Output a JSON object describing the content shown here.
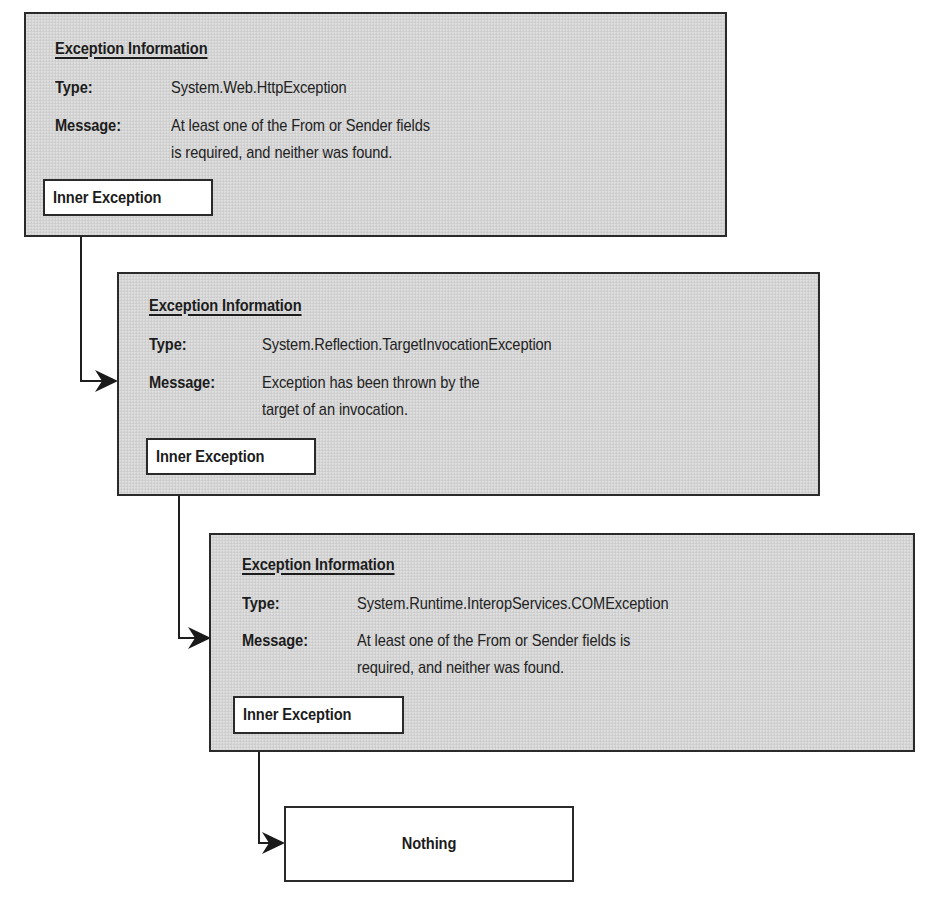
{
  "diagram": {
    "exceptions": [
      {
        "heading": "Exception Information",
        "type_label": "Type:",
        "type_value": "System.Web.HttpException",
        "message_label": "Message:",
        "message_lines": [
          "At least one of the From or Sender fields",
          "is required, and neither was found."
        ],
        "inner_label": "Inner Exception"
      },
      {
        "heading": "Exception Information",
        "type_label": "Type:",
        "type_value": "System.Reflection.TargetInvocationException",
        "message_label": "Message:",
        "message_lines": [
          "Exception has been thrown by the",
          "target of an invocation."
        ],
        "inner_label": "Inner Exception"
      },
      {
        "heading": "Exception Information",
        "type_label": "Type:",
        "type_value": "System.Runtime.InteropServices.COMException",
        "message_label": "Message:",
        "message_lines": [
          "At least one of the From or Sender fields is",
          "required, and neither was found."
        ],
        "inner_label": "Inner Exception"
      }
    ],
    "terminal": {
      "label": "Nothing"
    },
    "colors": {
      "box_fill": "#d4d4d4",
      "stroke": "#2a2a2a",
      "inner_fill": "#ffffff"
    }
  }
}
